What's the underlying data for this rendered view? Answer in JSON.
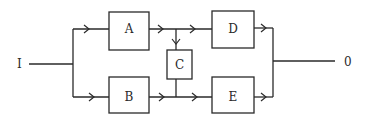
{
  "diagram": {
    "input_label": "I",
    "output_label": "0",
    "blocks": [
      {
        "id": "A",
        "label": "A"
      },
      {
        "id": "B",
        "label": "B"
      },
      {
        "id": "C",
        "label": "C"
      },
      {
        "id": "D",
        "label": "D"
      },
      {
        "id": "E",
        "label": "E"
      }
    ],
    "connections": [
      {
        "from": "I",
        "to": "A"
      },
      {
        "from": "I",
        "to": "B"
      },
      {
        "from": "A",
        "to": "D"
      },
      {
        "from": "A",
        "to": "C"
      },
      {
        "from": "C",
        "to": "B-E path"
      },
      {
        "from": "B",
        "to": "E"
      },
      {
        "from": "D",
        "to": "0"
      },
      {
        "from": "E",
        "to": "0"
      }
    ],
    "colors": {
      "line": "#2a2a2a",
      "background": "#ffffff"
    }
  }
}
